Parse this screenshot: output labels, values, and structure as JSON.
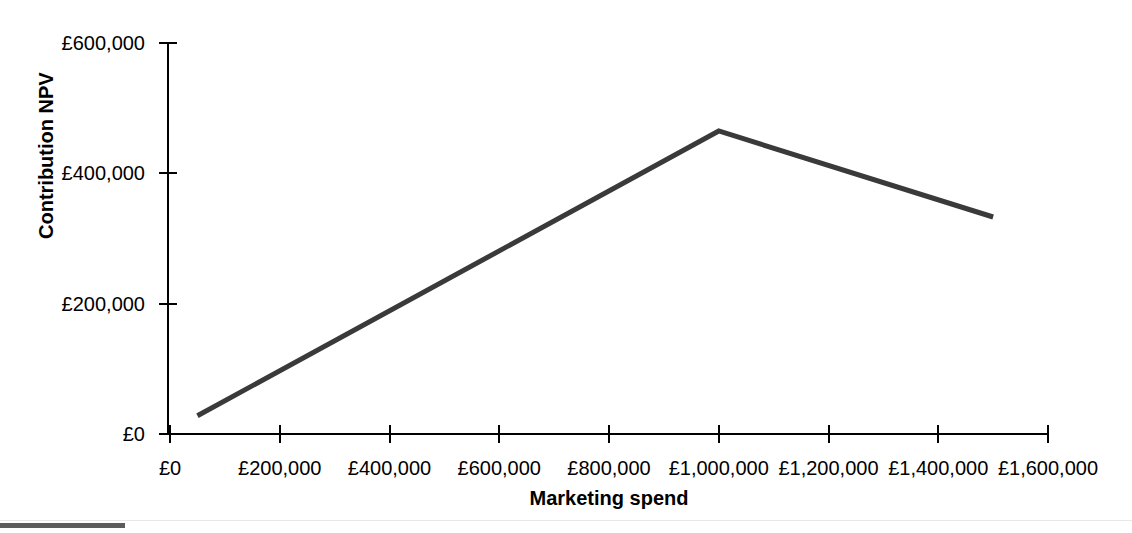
{
  "chart_data": {
    "type": "line",
    "title": "",
    "subtitle": "",
    "xlabel": "Marketing spend",
    "ylabel": "Contribution NPV",
    "xlim": [
      0,
      1600000
    ],
    "ylim": [
      0,
      600000
    ],
    "grid": false,
    "legend": false,
    "legend_position": "none",
    "currency_symbol": "£",
    "x_tick_labels": [
      "£0",
      "£200,000",
      "£400,000",
      "£600,000",
      "£800,000",
      "£1,000,000",
      "£1,200,000",
      "£1,400,000",
      "£1,600,000"
    ],
    "x_tick_values": [
      0,
      200000,
      400000,
      600000,
      800000,
      1000000,
      1200000,
      1400000,
      1600000
    ],
    "y_tick_labels": [
      "£0",
      "£200,000",
      "£400,000",
      "£600,000"
    ],
    "y_tick_values": [
      0,
      200000,
      400000,
      600000
    ],
    "series": [
      {
        "name": "Contribution NPV",
        "color": "#3a3a3a",
        "line_width": 5,
        "markers": false,
        "x": [
          50000,
          1000000,
          1500000
        ],
        "y": [
          28000,
          465000,
          333000
        ],
        "points": [
          {
            "x": 50000,
            "y": 28000
          },
          {
            "x": 1000000,
            "y": 465000
          },
          {
            "x": 1500000,
            "y": 333000
          }
        ]
      }
    ],
    "annotations": [],
    "axis_color": "#000000",
    "axis_line_width": 2,
    "background": "#ffffff"
  },
  "footer": {
    "tab_color": "#5c5c5c",
    "rule_color": "#e8e8e8",
    "tab_width": 125
  },
  "layout": {
    "plot_left": 170,
    "plot_right": 1048,
    "plot_top": 43,
    "plot_bottom": 434,
    "tick_size": 9,
    "y_label_gap": 14,
    "x_label_offset": 24,
    "x_title_offset": 54,
    "y_title_x": 36,
    "footer_rule_y": 520,
    "footer_tab_y": 523
  }
}
